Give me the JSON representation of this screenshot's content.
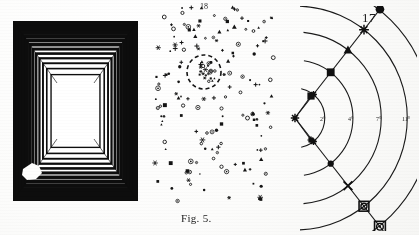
{
  "page": {
    "page_number": "17",
    "background_color": "#fbfbfa",
    "ink_color": "#111111"
  },
  "figures": {
    "tunnel": {
      "name": "tunnel-illusion",
      "caption": "",
      "description": "nested-square perspective tunnel",
      "ring_count": 13,
      "stripe_color": "#0d0d0d",
      "gap_color": "#ffffff",
      "blot": "white-ink-blot-lower-left"
    },
    "starfield": {
      "name": "star-field-scatter",
      "caption": "Fig. 5.",
      "top_mark": "18",
      "symbol_count": 150,
      "cluster": {
        "label": "dashed-circle-cluster",
        "cx": 52,
        "cy": 68,
        "r": 17,
        "member_count": 22
      },
      "symbol_kinds": [
        "dot",
        "open-circle",
        "triangle",
        "square",
        "cross",
        "star",
        "ring-dot"
      ]
    },
    "arcs": {
      "name": "concentric-arc-diagram",
      "page_number": "17",
      "center": {
        "x": 13,
        "y": 112
      },
      "arc_labels": [
        "2°",
        "4°",
        "7°",
        "11°",
        "21°"
      ],
      "arc_radii": [
        30,
        58,
        86,
        112,
        138
      ],
      "node_symbols": [
        "star",
        "square",
        "triangle",
        "asterisk",
        "dot",
        "cross",
        "ring",
        "target"
      ],
      "ray_angles_deg": [
        -52,
        52
      ]
    }
  },
  "chart_data": {
    "type": "scatter",
    "title": "Fig. 5.",
    "xlabel": "",
    "ylabel": "",
    "series": [
      {
        "name": "field-symbols",
        "values": [
          150
        ]
      },
      {
        "name": "cluster-members",
        "values": [
          22
        ]
      }
    ],
    "annotations": [
      "18",
      "Fig. 5.",
      "17"
    ]
  }
}
